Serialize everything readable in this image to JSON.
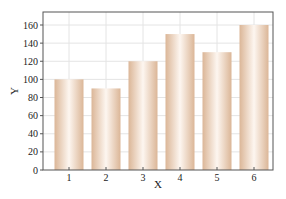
{
  "chart_data": {
    "type": "bar",
    "title": "",
    "xlabel": "X",
    "ylabel": "Y",
    "categories": [
      "1",
      "2",
      "3",
      "4",
      "5",
      "6"
    ],
    "values": [
      100,
      90,
      120,
      150,
      130,
      160
    ],
    "ylim": [
      0,
      170
    ],
    "yticks": [
      0,
      20,
      40,
      60,
      80,
      100,
      120,
      140,
      160
    ],
    "grid": true,
    "legend": null,
    "colors": {
      "bar_edge": "#dcb89a",
      "bar_center": "#fdf5ee",
      "grid": "#e4e4e4",
      "axis": "#555555"
    }
  }
}
